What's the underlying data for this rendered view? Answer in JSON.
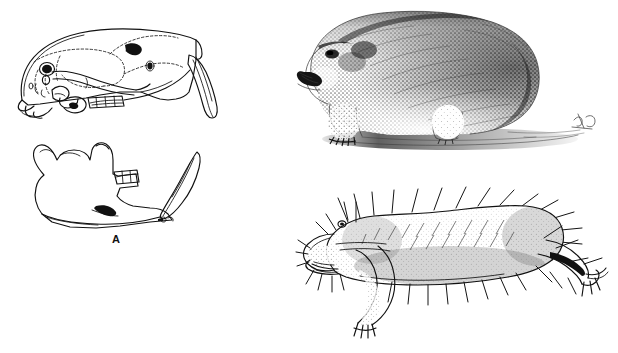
{
  "figure": {
    "background_color": "#ffffff",
    "ink_color": "#111111",
    "panel_count": 3
  },
  "panels": [
    {
      "id": "A",
      "label": "A",
      "type": "line-drawing",
      "subject": "skull-and-mandible-lateral-view",
      "elements": [
        "cranium-lateral-outline",
        "dashed-suture-lines",
        "orbit-foramen",
        "zygomatic-arch",
        "upper-toothrow",
        "upper-incisor-blade",
        "mandible-outline",
        "lower-toothrow",
        "lower-incisor-blade",
        "angular-process-shading"
      ]
    },
    {
      "id": "B",
      "label": "B",
      "type": "stipple-engraving",
      "subject": "mole-rat-whole-animal-lateral-view",
      "elements": [
        "stippled-body",
        "head-with-dark-eye",
        "protruding-incisors",
        "fore-limb",
        "hind-limb",
        "ground-shadow",
        "artist-monogram"
      ]
    },
    {
      "id": "C",
      "label": "C",
      "type": "line-drawing",
      "subject": "naked-mole-rat-whole-animal-lateral-view",
      "elements": [
        "body-outline",
        "stippled-shading",
        "sparse-bristles",
        "head-with-small-eye",
        "protruding-incisors",
        "whiskers",
        "fore-foot",
        "hind-foot",
        "thin-tail"
      ]
    }
  ]
}
